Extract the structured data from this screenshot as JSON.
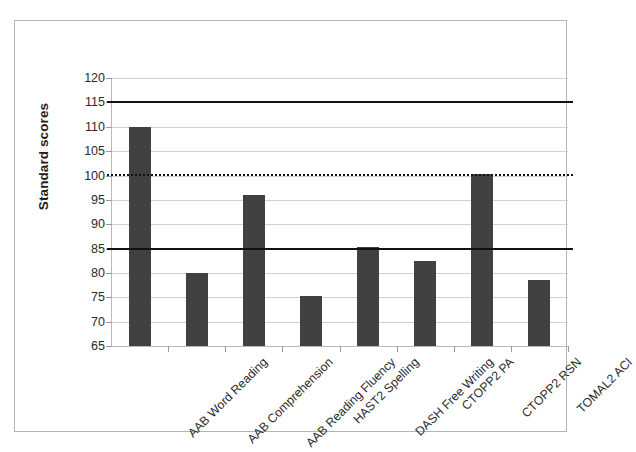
{
  "chart_data": {
    "type": "bar",
    "title": "",
    "xlabel": "",
    "ylabel": "Standard scores",
    "ylim": [
      65,
      120
    ],
    "yticks": [
      65,
      70,
      75,
      80,
      85,
      90,
      95,
      100,
      105,
      110,
      115,
      120
    ],
    "grid": true,
    "legend": "none",
    "bar_color": "#414141",
    "categories": [
      "AAB Word Reading",
      "AAB Comprehension",
      "AAB Reading Fluency",
      "HAST2 Spelling",
      "DASH Free Writing",
      "CTOPP2 PA",
      "CTOPP2 RSN",
      "TOMAL2 ACI"
    ],
    "values": [
      110,
      80,
      96,
      75.2,
      85.3,
      82.5,
      100.3,
      78.5
    ],
    "annotations": [
      {
        "name": "upper-reference-line",
        "value": 115,
        "style": "solid",
        "color": "#111111"
      },
      {
        "name": "mean-reference-line",
        "value": 100,
        "style": "dotted",
        "color": "#111111"
      },
      {
        "name": "lower-reference-line",
        "value": 85,
        "style": "solid",
        "color": "#111111"
      }
    ]
  },
  "axis": {
    "y_tick_labels": [
      "120",
      "115",
      "110",
      "105",
      "100",
      "95",
      "90",
      "85",
      "80",
      "75",
      "70",
      "65"
    ],
    "y_title": "Standard scores"
  }
}
